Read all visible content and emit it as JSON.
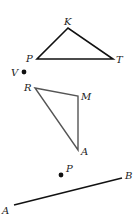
{
  "figures": {
    "triangle_pkt": {
      "vertices": [
        {
          "label": "K",
          "x": 68,
          "y": 28,
          "lx": 64,
          "ly": 25
        },
        {
          "label": "P",
          "x": 37,
          "y": 59,
          "lx": 26,
          "ly": 62
        },
        {
          "label": "T",
          "x": 113,
          "y": 59,
          "lx": 116,
          "ly": 63
        }
      ]
    },
    "point_v": {
      "label": "V",
      "x": 24,
      "y": 72,
      "lx": 11,
      "ly": 76
    },
    "triangle_rma": {
      "vertices": [
        {
          "label": "R",
          "x": 35,
          "y": 88,
          "lx": 24,
          "ly": 91
        },
        {
          "label": "M",
          "x": 78,
          "y": 96,
          "lx": 81,
          "ly": 100
        },
        {
          "label": "A",
          "x": 78,
          "y": 150,
          "lx": 81,
          "ly": 155
        }
      ]
    },
    "point_p": {
      "label": "P",
      "x": 61,
      "y": 175,
      "lx": 66,
      "ly": 172
    },
    "segment_ab": {
      "start": {
        "label": "A",
        "x": 14,
        "y": 205,
        "lx": 2,
        "ly": 214
      },
      "end": {
        "label": "B",
        "x": 122,
        "y": 178,
        "lx": 125,
        "ly": 179
      }
    }
  },
  "colors": {
    "line": "#111111",
    "label": "#222222",
    "background": "#ffffff"
  }
}
